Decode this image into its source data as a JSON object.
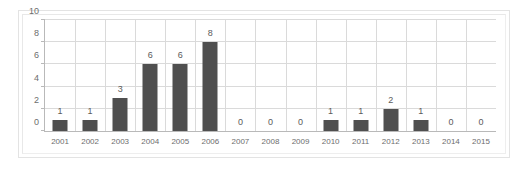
{
  "chart_data": {
    "type": "bar",
    "title": "",
    "subtitle": "",
    "xlabel": "",
    "ylabel": "",
    "categories": [
      "2001",
      "2002",
      "2003",
      "2004",
      "2005",
      "2006",
      "2007",
      "2008",
      "2009",
      "2010",
      "2011",
      "2012",
      "2013",
      "2014",
      "2015"
    ],
    "values": [
      1,
      1,
      3,
      6,
      6,
      8,
      0,
      0,
      0,
      1,
      1,
      2,
      1,
      0,
      0
    ],
    "data_labels": [
      "1",
      "1",
      "3",
      "6",
      "6",
      "8",
      "0",
      "0",
      "0",
      "1",
      "1",
      "2",
      "1",
      "0",
      "0"
    ],
    "ylim": [
      0,
      10
    ],
    "yticks": [
      0,
      2,
      4,
      6,
      8,
      10
    ],
    "ytick_labels": [
      "0",
      "2",
      "4",
      "6",
      "8",
      "10"
    ],
    "grid": true,
    "grid_axis": "both",
    "legend": false,
    "legend_position": "none",
    "series": [
      {
        "name": "",
        "values": [
          1,
          1,
          3,
          6,
          6,
          8,
          0,
          0,
          0,
          1,
          1,
          2,
          1,
          0,
          0
        ]
      }
    ]
  },
  "style": {
    "bar_color": "#4f4f4f",
    "grid_color": "#dadada",
    "axis_color": "#b9b9b9",
    "label_color": "#6d6d6d",
    "value_color": "#5a5a5a",
    "frame_color": "#e3e3e3",
    "background": "#ffffff"
  }
}
